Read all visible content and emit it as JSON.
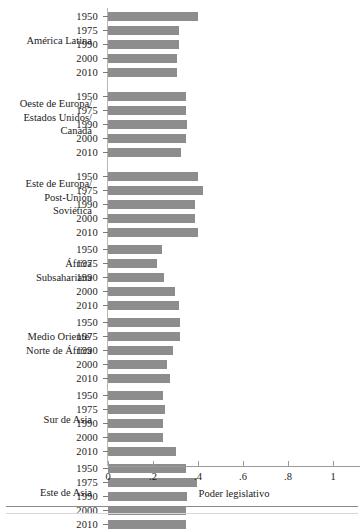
{
  "chart_data": {
    "type": "bar",
    "orientation": "horizontal",
    "title": "",
    "xlabel": "Poder legislativo",
    "ylabel": "",
    "xlim": [
      0,
      1
    ],
    "xticks": [
      0,
      0.2,
      0.4,
      0.6,
      0.8,
      1
    ],
    "xtick_labels": [
      "0",
      ".2",
      ".4",
      ".6",
      ".8",
      "1"
    ],
    "grid": false,
    "legend": null,
    "bar_color": "#8d8d8d",
    "categories": [
      "1950",
      "1975",
      "1990",
      "2000",
      "2010"
    ],
    "groups": [
      {
        "label": "América Latina",
        "label_lines": [
          "América Latina"
        ],
        "values": [
          0.4,
          0.315,
          0.315,
          0.307,
          0.307
        ]
      },
      {
        "label": "Oeste de Europa/ Estados Unidos/ Canadá",
        "label_lines": [
          "Oeste de Europa/",
          "Estados Unidos/",
          "Canadá"
        ],
        "values": [
          0.345,
          0.348,
          0.352,
          0.345,
          0.325
        ]
      },
      {
        "label": "Este de Europa/ Post-Unión Soviética",
        "label_lines": [
          "Este de Europa/",
          "Post-Unión",
          "Soviética"
        ],
        "values": [
          0.402,
          0.422,
          0.387,
          0.387,
          0.4
        ]
      },
      {
        "label": "África Subsahariana",
        "label_lines": [
          "África",
          "Subsahariana"
        ],
        "values": [
          0.242,
          0.218,
          0.25,
          0.298,
          0.316
        ]
      },
      {
        "label": "Medio Oriente/ Norte de África",
        "label_lines": [
          "Medio Oriente/",
          "Norte de África"
        ],
        "values": [
          0.32,
          0.318,
          0.29,
          0.262,
          0.276
        ]
      },
      {
        "label": "Sur de Asia",
        "label_lines": [
          "Sur de Asia"
        ],
        "values": [
          0.245,
          0.253,
          0.245,
          0.243,
          0.3
        ]
      },
      {
        "label": "Este de Asia",
        "label_lines": [
          "Este de Asia"
        ],
        "values": [
          0.347,
          0.395,
          0.35,
          0.347,
          0.347
        ]
      }
    ]
  }
}
